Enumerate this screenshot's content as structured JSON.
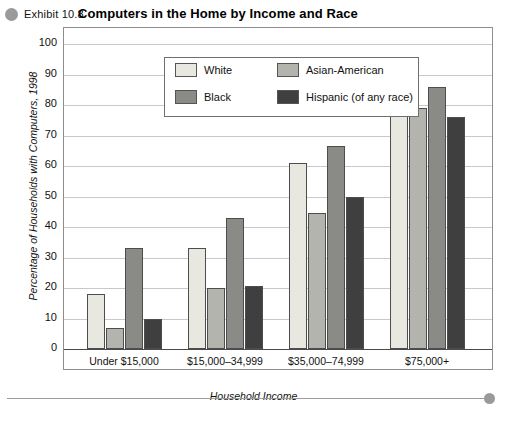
{
  "header": {
    "exhibit_label": "Exhibit 10.8",
    "title": "Computers in the Home by Income and Race",
    "bullet_icon": "circle-bullet-icon"
  },
  "footer": {
    "caption": ""
  },
  "chart_data": {
    "type": "bar",
    "title": "Computers in the Home by Income and Race",
    "xlabel": "Household Income",
    "ylabel": "Percentage of Households with Computers, 1998",
    "categories": [
      "Under $15,000",
      "$15,000–34,999",
      "$35,000–74,999",
      "$75,000+"
    ],
    "series": [
      {
        "name": "White",
        "color": "#e8e8e0",
        "values": [
          18,
          33,
          61,
          81
        ]
      },
      {
        "name": "Asian-American",
        "color": "#b4b4ae",
        "values": [
          7,
          20,
          44.5,
          79
        ]
      },
      {
        "name": "Black",
        "color": "#8a8a86",
        "values": [
          33,
          43,
          66.5,
          86
        ]
      },
      {
        "name": "Hispanic (of any race)",
        "color": "#3f3f3f",
        "values": [
          10,
          20.5,
          50,
          76
        ]
      }
    ],
    "ylim": [
      0,
      100
    ],
    "yticks": [
      0,
      10,
      20,
      30,
      40,
      50,
      60,
      70,
      80,
      90,
      100
    ],
    "ytick_labels": [
      "0",
      "10",
      "20",
      "30",
      "40",
      "50",
      "60",
      "70",
      "80",
      "90",
      "100"
    ],
    "grid": true,
    "legend_position": "top-left-inside"
  },
  "legend": {
    "items": [
      {
        "label": "White",
        "color": "#e8e8e0"
      },
      {
        "label": "Asian-American",
        "color": "#b4b4ae"
      },
      {
        "label": "Black",
        "color": "#8a8a86"
      },
      {
        "label": "Hispanic (of any race)",
        "color": "#3f3f3f"
      }
    ]
  }
}
